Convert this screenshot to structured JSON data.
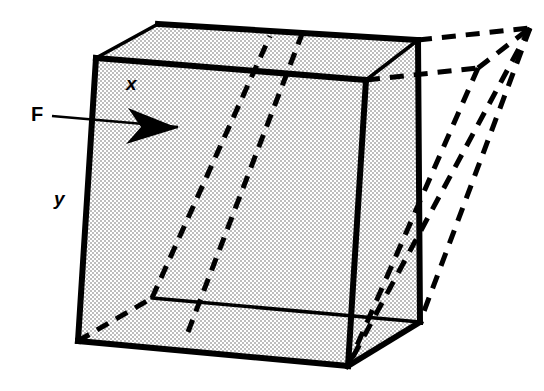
{
  "figure": {
    "kind": "shear-deformation-diagram",
    "caption_labels": {
      "force_label": "F",
      "x_label": "x",
      "y_label": "y"
    },
    "colors": {
      "stroke": "#000000",
      "fill_gray": "#d9d9d9",
      "background": "#ffffff",
      "dash_stroke": "#000000"
    },
    "line_widths": {
      "solid_edge": 6,
      "interior_edge": 3.5,
      "dashed_edge": 5,
      "arrow_shaft": 2.2
    },
    "dash_patterns": {
      "hidden_edge": "13 9",
      "deformed_edge": "14 10"
    }
  },
  "geometry": {
    "undeformed_cube": {
      "front_face": {
        "name": "front-face",
        "points": "96,58 366,80 348,366 78,341"
      },
      "top_face": {
        "name": "top-face",
        "points": "96,58 158,24 418,40 366,80"
      },
      "right_face": {
        "name": "right-face",
        "points": "366,80 418,40 420,322 348,366"
      },
      "bottom_face": {
        "name": "bottom-face",
        "points": "78,341 348,366 420,322 152,298"
      },
      "outline": {
        "name": "cube-outline",
        "points": "158,24 418,40 420,322 348,366 78,341 96,58"
      },
      "edge_front_top": {
        "x1": 96,
        "y1": 58,
        "x2": 366,
        "y2": 80
      },
      "edge_front_right": {
        "x1": 366,
        "y1": 80,
        "x2": 348,
        "y2": 366
      },
      "edge_front_left": {
        "x1": 96,
        "y1": 58,
        "x2": 78,
        "y2": 341
      },
      "edge_front_bottom": {
        "x1": 78,
        "y1": 341,
        "x2": 348,
        "y2": 366
      },
      "edge_top_left": {
        "x1": 96,
        "y1": 58,
        "x2": 158,
        "y2": 24
      },
      "edge_top_back": {
        "x1": 158,
        "y1": 24,
        "x2": 418,
        "y2": 40
      },
      "edge_top_right": {
        "x1": 366,
        "y1": 80,
        "x2": 418,
        "y2": 40
      },
      "edge_back_right": {
        "x1": 418,
        "y1": 40,
        "x2": 420,
        "y2": 322
      },
      "edge_bottom_right": {
        "x1": 348,
        "y1": 366,
        "x2": 420,
        "y2": 322
      },
      "edge_bottom_back": {
        "x1": 420,
        "y1": 322,
        "x2": 152,
        "y2": 298
      },
      "hidden_back_left_vertical": {
        "x1": 152,
        "y1": 298,
        "x2": 158,
        "y2": 24
      },
      "hidden_bottom_back_left": {
        "x1": 78,
        "y1": 341,
        "x2": 152,
        "y2": 298
      }
    },
    "deformed_cube": {
      "description": "dashed sheared outline displaced to the right",
      "top_back_right": {
        "x": 530,
        "y": 28
      },
      "top_front_right": {
        "x": 478,
        "y": 68
      },
      "bottom_back_right": {
        "x": 420,
        "y": 322
      },
      "bottom_front_right": {
        "x": 348,
        "y": 366
      },
      "dash_top_back": {
        "x1": 418,
        "y1": 40,
        "x2": 530,
        "y2": 28
      },
      "dash_top_front": {
        "x1": 366,
        "y1": 80,
        "x2": 478,
        "y2": 68
      },
      "dash_top_side": {
        "x1": 478,
        "y1": 68,
        "x2": 530,
        "y2": 28
      },
      "dash_right_back": {
        "x1": 530,
        "y1": 28,
        "x2": 420,
        "y2": 322
      },
      "dash_right_front": {
        "x1": 478,
        "y1": 68,
        "x2": 348,
        "y2": 366
      },
      "dash_inner_diag": {
        "x1": 530,
        "y1": 28,
        "x2": 348,
        "y2": 366
      }
    },
    "interior_shear_dashes": {
      "left_slant": {
        "x1": 152,
        "y1": 298,
        "x2": 270,
        "y2": 36
      },
      "right_slant": {
        "x1": 188,
        "y1": 332,
        "x2": 302,
        "y2": 34
      }
    },
    "force_arrow": {
      "name": "force-arrow",
      "shaft": {
        "x1": 52,
        "y1": 116,
        "x2": 178,
        "y2": 127
      },
      "head": "128,108 178,128 126,144 141,127",
      "direction": "right"
    }
  }
}
